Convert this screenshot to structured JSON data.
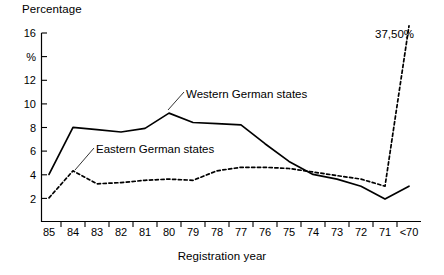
{
  "chart_data": {
    "type": "line",
    "title": "",
    "ylabel": "Percentage",
    "xlabel": "Registration year",
    "yunit": "%",
    "categories": [
      "85",
      "84",
      "83",
      "82",
      "81",
      "80",
      "79",
      "78",
      "77",
      "76",
      "75",
      "74",
      "73",
      "72",
      "71",
      "<70"
    ],
    "ylim": [
      0,
      16
    ],
    "yticks": [
      0,
      2,
      4,
      6,
      8,
      10,
      12,
      14,
      16
    ],
    "ytick_labels": [
      "",
      "2",
      "4",
      "6",
      "8",
      "10",
      "12",
      "%",
      "16"
    ],
    "grid": false,
    "legend": "inline-annotations",
    "series": [
      {
        "name": "Western German states",
        "style": "solid",
        "color": "#000000",
        "values": [
          4.0,
          8.0,
          7.8,
          7.6,
          7.9,
          9.2,
          8.4,
          8.3,
          8.2,
          6.6,
          5.1,
          4.0,
          3.6,
          3.0,
          1.9,
          3.0
        ]
      },
      {
        "name": "Eastern German states",
        "style": "dashed",
        "color": "#000000",
        "values": [
          2.0,
          4.3,
          3.2,
          3.3,
          3.5,
          3.6,
          3.5,
          4.3,
          4.6,
          4.6,
          4.5,
          4.2,
          3.9,
          3.6,
          3.0,
          37.5
        ]
      }
    ],
    "annotations": [
      {
        "name": "peak-value-label",
        "text": "37,50%",
        "category": "<70",
        "value": 37.5
      }
    ]
  },
  "labels": {
    "y_axis_title": "Percentage",
    "x_axis_title": "Registration year",
    "western_series": "Western German states",
    "eastern_series": "Eastern German states",
    "peak_annotation": "37,50%"
  },
  "ytick_text": {
    "t16": "16",
    "t14": "%",
    "t12": "12",
    "t10": "10",
    "t8": "8",
    "t6": "6",
    "t4": "4",
    "t2": "2"
  },
  "xtick_text": {
    "c0": "85",
    "c1": "84",
    "c2": "83",
    "c3": "82",
    "c4": "81",
    "c5": "80",
    "c6": "79",
    "c7": "78",
    "c8": "77",
    "c9": "76",
    "c10": "75",
    "c11": "74",
    "c12": "73",
    "c13": "72",
    "c14": "71",
    "c15": "<70"
  }
}
